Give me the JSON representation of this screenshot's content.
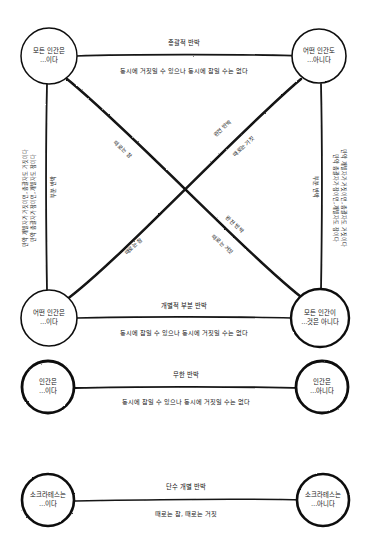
{
  "colors": {
    "ink": "#111111",
    "stroke": "#1a1a1a",
    "background": "#ffffff"
  },
  "square": {
    "nodes": {
      "top_left": {
        "id": "A",
        "line1": "모든 인간은",
        "line2": "…이다"
      },
      "top_right": {
        "id": "E",
        "line1": "어떤 인간도",
        "line2": "…아니다"
      },
      "bottom_left": {
        "id": "I",
        "line1": "어떤 인간은",
        "line2": "…이다"
      },
      "bottom_right": {
        "id": "O",
        "line1": "모든 인간이",
        "line2": "…것은 아니다"
      }
    },
    "edges": {
      "top": {
        "name": "총괄적 반박",
        "desc": "동시에 거짓일 수 있으나 동시에 참일 수는 없다"
      },
      "bottom": {
        "name": "개별적 부분 반박",
        "desc": "동시에 참일 수 있으나 동시에 거짓일 수는 없다"
      },
      "left": {
        "name": "부분 반박",
        "desc_line1": "만약 개별자가 거짓이면, 총괄자도 거짓이다",
        "desc_line2": "만약 총괄자가 참이면, 개별자도 참이다"
      },
      "right": {
        "name": "부분 반박",
        "desc_line1": "만약 개별자가 거짓이면, 총괄자도 거짓이다",
        "desc_line2": "만약 총괄자가 참이면, 개별자도 참이다"
      },
      "diag_a_o": {
        "name": "완전 반박",
        "upper": "때로는 참",
        "lower": "때로는 거짓"
      },
      "diag_e_i": {
        "name": "완전 반박",
        "upper": "때로는 참",
        "lower": "때로는 거짓"
      }
    },
    "diagonal_labels": {
      "upper_left": "때로는 참",
      "upper_right_top": "완전 반박",
      "upper_right_bottom": "때로는 거짓",
      "lower_left": "때로는 참",
      "lower_right_top": "완전 반박",
      "lower_right_bottom": "때로는 거짓"
    }
  },
  "middle_row": {
    "left_node": {
      "line1": "인간은",
      "line2": "…이다"
    },
    "right_node": {
      "line1": "인간은",
      "line2": "…아니다"
    },
    "edge": {
      "name": "무한 반박",
      "desc": "동시에 참일 수 있으나 동시에 거짓일 수는 없다"
    }
  },
  "bottom_row": {
    "left_node": {
      "line1": "소크라테스는",
      "line2": "…이다"
    },
    "right_node": {
      "line1": "소크라테스는",
      "line2": "…아니다"
    },
    "edge": {
      "name": "단수 개별 반박",
      "desc": "때로는 참, 때로는 거짓"
    }
  }
}
